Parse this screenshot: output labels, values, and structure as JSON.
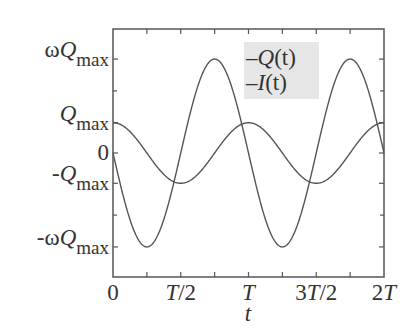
{
  "chart_data": {
    "type": "line",
    "title": "",
    "xlabel": "t",
    "ylabel": "",
    "x_range": [
      0,
      2
    ],
    "x_unit": "T",
    "x_ticks": [
      {
        "value": 0,
        "label": "0"
      },
      {
        "value": 0.5,
        "label": "T/2"
      },
      {
        "value": 1,
        "label": "T"
      },
      {
        "value": 1.5,
        "label": "3T/2"
      },
      {
        "value": 2,
        "label": "2T"
      }
    ],
    "x_minor_ticks": [
      0.25,
      0.75,
      1.25,
      1.75
    ],
    "y_ticks": [
      {
        "value": 3.1,
        "label_prefix": "ω",
        "label_var": "Q",
        "label_sub": "max"
      },
      {
        "value": 1,
        "label_prefix": "",
        "label_var": "Q",
        "label_sub": "max"
      },
      {
        "value": 0,
        "label_prefix": "",
        "label_var": "0",
        "label_sub": ""
      },
      {
        "value": -1,
        "label_prefix": "-",
        "label_var": "Q",
        "label_sub": "max"
      },
      {
        "value": -3.1,
        "label_prefix": "-ω",
        "label_var": "Q",
        "label_sub": "max"
      }
    ],
    "y_range": [
      -4.0,
      4.0
    ],
    "grid": false,
    "legend_position": "upper-right-inside",
    "series": [
      {
        "name": "Q(t)",
        "label_var": "Q",
        "formula": "Qmax*cos(2*pi*t/T)",
        "amplitude": 1,
        "phase": "cos",
        "color": "#555555"
      },
      {
        "name": "I(t)",
        "label_var": "I",
        "formula": "-omega*Qmax*sin(2*pi*t/T)",
        "amplitude": 3.1,
        "phase": "-sin",
        "color": "#555555"
      }
    ],
    "sample_points": {
      "t": [
        0,
        0.25,
        0.5,
        0.75,
        1,
        1.25,
        1.5,
        1.75,
        2
      ],
      "Q": [
        1,
        0,
        -1,
        0,
        1,
        0,
        -1,
        0,
        1
      ],
      "I": [
        0,
        -3.1,
        0,
        3.1,
        0,
        -3.1,
        0,
        3.1,
        0
      ]
    }
  },
  "legend": {
    "dash": "–",
    "items": [
      {
        "var": "Q",
        "arg": "(t)"
      },
      {
        "var": "I",
        "arg": "(t)"
      }
    ]
  },
  "axis": {
    "x_title": "t",
    "x_labels": [
      "0",
      "T/2",
      "T",
      "3T/2",
      "2T"
    ]
  }
}
